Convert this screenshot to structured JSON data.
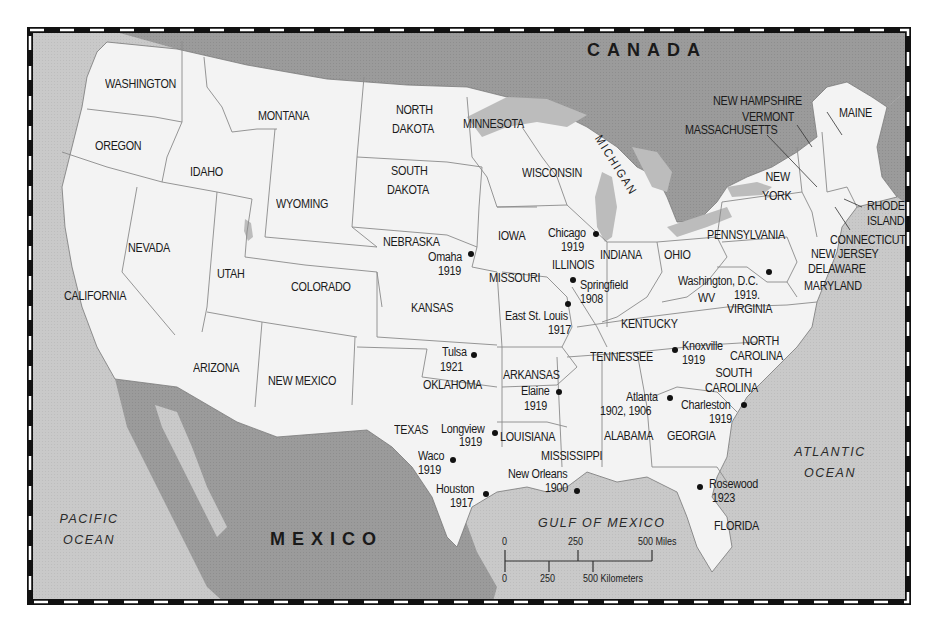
{
  "map": {
    "colors": {
      "land_us": "#f3f3f3",
      "ocean": "#c9c9c9",
      "foreign_land": "#9b9b9b",
      "lakes": "#bcbcbc",
      "border": "#111111",
      "state_lines": "#8a8a8a"
    },
    "countries": {
      "canada": "CANADA",
      "mexico": "MEXICO"
    },
    "water_bodies": {
      "pacific_line1": "PACIFIC",
      "pacific_line2": "OCEAN",
      "atlantic_line1": "ATLANTIC",
      "atlantic_line2": "OCEAN",
      "gulf": "GULF OF MEXICO"
    },
    "states": {
      "washington": "WASHINGTON",
      "oregon": "OREGON",
      "california": "CALIFORNIA",
      "nevada": "NEVADA",
      "idaho": "IDAHO",
      "montana": "MONTANA",
      "wyoming": "WYOMING",
      "utah": "UTAH",
      "arizona": "ARIZONA",
      "colorado": "COLORADO",
      "new_mexico": "NEW MEXICO",
      "north_dakota_1": "NORTH",
      "north_dakota_2": "DAKOTA",
      "south_dakota_1": "SOUTH",
      "south_dakota_2": "DAKOTA",
      "nebraska": "NEBRASKA",
      "kansas": "KANSAS",
      "oklahoma": "OKLAHOMA",
      "texas": "TEXAS",
      "minnesota": "MINNESOTA",
      "iowa": "IOWA",
      "missouri": "MISSOURI",
      "arkansas": "ARKANSAS",
      "louisiana": "LOUISIANA",
      "wisconsin": "WISCONSIN",
      "illinois": "ILLINOIS",
      "michigan": "MICHIGAN",
      "indiana": "INDIANA",
      "ohio": "OHIO",
      "kentucky": "KENTUCKY",
      "tennessee": "TENNESSEE",
      "mississippi": "MISSISSIPPI",
      "alabama": "ALABAMA",
      "georgia": "GEORGIA",
      "florida": "FLORIDA",
      "south_carolina_1": "SOUTH",
      "south_carolina_2": "CAROLINA",
      "north_carolina_1": "NORTH",
      "north_carolina_2": "CAROLINA",
      "virginia": "VIRGINIA",
      "west_virginia": "WV",
      "pennsylvania": "PENNSYLVANIA",
      "new_york_1": "NEW",
      "new_york_2": "YORK",
      "maine": "MAINE",
      "new_hampshire": "NEW HAMPSHIRE",
      "vermont": "VERMONT",
      "massachusetts": "MASSACHUSETTS",
      "rhode_island_1": "RHODE",
      "rhode_island_2": "ISLAND",
      "connecticut": "CONNECTICUT",
      "new_jersey": "NEW JERSEY",
      "delaware": "DELAWARE",
      "maryland": "MARYLAND"
    },
    "cities": [
      {
        "name": "Omaha",
        "year": "1919"
      },
      {
        "name": "Chicago",
        "year": "1919"
      },
      {
        "name": "Springfield",
        "year": "1908"
      },
      {
        "name": "East St. Louis",
        "year": "1917"
      },
      {
        "name": "Washington, D.C.",
        "year": "1919."
      },
      {
        "name": "Tulsa",
        "year": "1921"
      },
      {
        "name": "Knoxville",
        "year": "1919"
      },
      {
        "name": "Elaine",
        "year": "1919"
      },
      {
        "name": "Atlanta",
        "year": "1902, 1906"
      },
      {
        "name": "Charleston",
        "year": "1919"
      },
      {
        "name": "Longview",
        "year": "1919"
      },
      {
        "name": "Waco",
        "year": "1919"
      },
      {
        "name": "Houston",
        "year": "1917"
      },
      {
        "name": "New Orleans",
        "year": "1900"
      },
      {
        "name": "Rosewood",
        "year": "1923"
      }
    ],
    "scale_bar": {
      "miles_ticks": [
        "0",
        "250",
        "500 Miles"
      ],
      "km_ticks": [
        "0",
        "250",
        "500 Kilometers"
      ]
    }
  }
}
